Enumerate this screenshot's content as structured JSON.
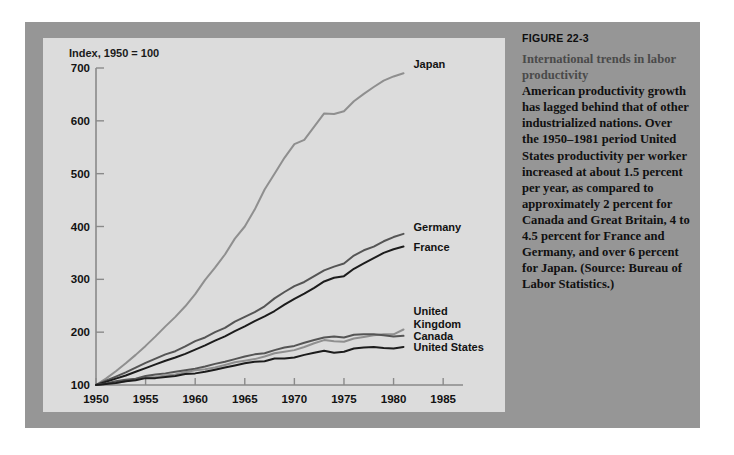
{
  "figure": {
    "number": "FIGURE 22-3",
    "headline": "International trends in labor productivity",
    "body": "American productivity growth has lagged behind that of other industrialized nations. Over the 1950–1981 period United States productivity per worker increased at about 1.5 percent per year, as compared to approximately 2 percent for Canada and Great Britain, 4 to 4.5 percent for France and Germany, and over 6 percent for Japan. (Source: Bureau of Labor Statistics.)"
  },
  "colors": {
    "page_background": "#ffffff",
    "figure_panel": "#969696",
    "chart_plate": "#dcdcdc",
    "axis": "#8a8a8a",
    "dark_line": "#1c1c1c",
    "mid_line": "#555555",
    "light_line": "#8f8f8f",
    "caption_headline": "#4a4a4a",
    "caption_body": "#101010"
  },
  "chart_data": {
    "type": "line",
    "title": "",
    "ylabel": "Index, 1950 = 100",
    "xlabel": "",
    "xlim": [
      1950,
      1987
    ],
    "ylim": [
      100,
      700
    ],
    "grid": false,
    "legend": "inline-right-end-labels",
    "xticks": [
      1950,
      1955,
      1960,
      1965,
      1970,
      1975,
      1980,
      1985
    ],
    "xticklabels": [
      "1950",
      "1955",
      "1960",
      "1965",
      "1970",
      "1975",
      "1980",
      "1985"
    ],
    "yticks": [
      100,
      200,
      300,
      400,
      500,
      600,
      700
    ],
    "yticklabels": [
      "100",
      "200",
      "300",
      "400",
      "500",
      "600",
      "700"
    ],
    "x": [
      1950,
      1951,
      1952,
      1953,
      1954,
      1955,
      1956,
      1957,
      1958,
      1959,
      1960,
      1961,
      1962,
      1963,
      1964,
      1965,
      1966,
      1967,
      1968,
      1969,
      1970,
      1971,
      1972,
      1973,
      1974,
      1975,
      1976,
      1977,
      1978,
      1979,
      1980,
      1981
    ],
    "series": [
      {
        "name": "Japan",
        "color": "#8f8f8f",
        "label": "Japan",
        "values": [
          100,
          112,
          126,
          141,
          157,
          174,
          192,
          211,
          229,
          249,
          272,
          299,
          322,
          347,
          377,
          400,
          432,
          470,
          500,
          530,
          556,
          564,
          589,
          614,
          613,
          618,
          637,
          651,
          664,
          676,
          684,
          690
        ]
      },
      {
        "name": "Germany",
        "color": "#555555",
        "label": "Germany",
        "values": [
          100,
          108,
          116,
          124,
          133,
          142,
          150,
          158,
          164,
          173,
          183,
          190,
          200,
          208,
          220,
          229,
          238,
          249,
          264,
          276,
          287,
          295,
          306,
          317,
          324,
          330,
          345,
          355,
          362,
          372,
          380,
          386
        ]
      },
      {
        "name": "France",
        "color": "#1c1c1c",
        "label": "France",
        "values": [
          100,
          106,
          112,
          118,
          125,
          132,
          139,
          146,
          152,
          159,
          167,
          175,
          184,
          192,
          202,
          211,
          221,
          230,
          240,
          252,
          263,
          273,
          284,
          296,
          303,
          306,
          320,
          330,
          340,
          350,
          357,
          362
        ]
      },
      {
        "name": "United Kingdom",
        "color": "#8f8f8f",
        "label": "United Kingdom",
        "values": [
          100,
          102,
          104,
          107,
          111,
          114,
          115,
          118,
          120,
          124,
          128,
          130,
          133,
          138,
          143,
          146,
          149,
          154,
          160,
          163,
          166,
          172,
          179,
          185,
          183,
          182,
          188,
          191,
          194,
          196,
          196,
          205
        ]
      },
      {
        "name": "Canada",
        "color": "#555555",
        "label": "Canada",
        "values": [
          100,
          103,
          107,
          110,
          112,
          117,
          120,
          122,
          125,
          128,
          131,
          135,
          140,
          144,
          149,
          154,
          158,
          160,
          166,
          171,
          174,
          180,
          185,
          190,
          192,
          190,
          195,
          196,
          196,
          194,
          192,
          193
        ]
      },
      {
        "name": "United States",
        "color": "#1c1c1c",
        "label": "United States",
        "values": [
          100,
          102,
          104,
          107,
          109,
          113,
          113,
          115,
          117,
          121,
          122,
          125,
          129,
          133,
          137,
          141,
          144,
          145,
          150,
          150,
          152,
          157,
          161,
          165,
          161,
          163,
          169,
          171,
          172,
          170,
          169,
          172
        ]
      }
    ],
    "annotations": [
      {
        "text": "Index, 1950 = 100",
        "role": "y-axis-title",
        "x": 1951,
        "y": 715
      }
    ]
  }
}
